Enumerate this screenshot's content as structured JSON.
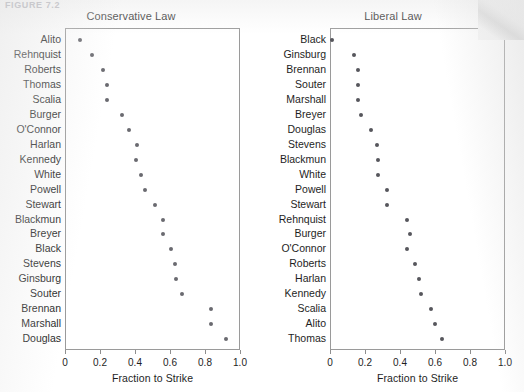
{
  "figure": {
    "caption": "FIGURE 7.2",
    "axis_title": "Fraction to Strike",
    "tick_labels": [
      "0",
      "0.2",
      "0.4",
      "0.6",
      "0.8",
      "1.0"
    ],
    "dot_color": "#6a6a70",
    "frame_color": "#9a9a9a"
  },
  "chart_data": [
    {
      "type": "scatter",
      "title": "Conservative Law",
      "xlabel": "Fraction to Strike",
      "ylabel": "",
      "xlim": [
        0,
        1
      ],
      "xticks": [
        0,
        0.2,
        0.4,
        0.6,
        0.8,
        1.0
      ],
      "xtick_labels": [
        "0",
        "0.2",
        "0.4",
        "0.6",
        "0.8",
        "1.0"
      ],
      "grid": false,
      "legend": "none",
      "orientation": "horizontal-dot-plot",
      "categories": [
        "Alito",
        "Rehnquist",
        "Roberts",
        "Thomas",
        "Scalia",
        "Burger",
        "O'Connor",
        "Harlan",
        "Kennedy",
        "White",
        "Powell",
        "Stewart",
        "Blackmun",
        "Breyer",
        "Black",
        "Stevens",
        "Ginsburg",
        "Souter",
        "Brennan",
        "Marshall",
        "Douglas"
      ],
      "values": [
        0.08,
        0.15,
        0.21,
        0.235,
        0.235,
        0.32,
        0.36,
        0.405,
        0.4,
        0.43,
        0.45,
        0.51,
        0.555,
        0.555,
        0.6,
        0.625,
        0.63,
        0.665,
        0.83,
        0.83,
        0.915
      ]
    },
    {
      "type": "scatter",
      "title": "Liberal Law",
      "xlabel": "Fraction to Strike",
      "ylabel": "",
      "xlim": [
        0,
        1
      ],
      "xticks": [
        0,
        0.2,
        0.4,
        0.6,
        0.8,
        1.0
      ],
      "xtick_labels": [
        "0",
        "0.2",
        "0.4",
        "0.6",
        "0.8",
        "1.0"
      ],
      "grid": false,
      "legend": "none",
      "orientation": "horizontal-dot-plot",
      "categories": [
        "Black",
        "Ginsburg",
        "Brennan",
        "Souter",
        "Marshall",
        "Breyer",
        "Douglas",
        "Stevens",
        "Blackmun",
        "White",
        "Powell",
        "Stewart",
        "Rehnquist",
        "Burger",
        "O'Connor",
        "Roberts",
        "Harlan",
        "Kennedy",
        "Scalia",
        "Alito",
        "Thomas"
      ],
      "values": [
        0.005,
        0.13,
        0.155,
        0.155,
        0.155,
        0.17,
        0.23,
        0.26,
        0.27,
        0.27,
        0.32,
        0.32,
        0.435,
        0.45,
        0.435,
        0.48,
        0.5,
        0.515,
        0.57,
        0.595,
        0.635
      ]
    }
  ]
}
